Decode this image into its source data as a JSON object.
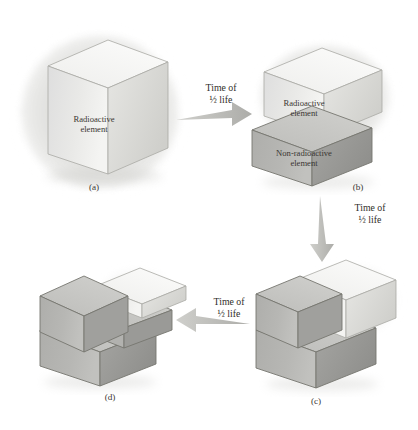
{
  "figure": {
    "colors": {
      "radioactive_front": "#e8e8e6",
      "radioactive_top": "#f2f2f0",
      "radioactive_side": "#d8d8d5",
      "nonradioactive_front": "#b4b4b2",
      "nonradioactive_top": "#c8c8c5",
      "nonradioactive_side": "#9c9c99",
      "outline": "#6a6a66",
      "text": "#3a3632",
      "glow": "#d9d9d6",
      "arrow": "#b9b9b6",
      "background": "#ffffff"
    }
  },
  "materials": {
    "radioactive": "Radioactive\nelement",
    "non_radioactive": "Non-radioactive\nelement"
  },
  "panels": [
    {
      "id": "a",
      "caption": "(a)",
      "face_label": "Radioactive\nelement",
      "glow": true,
      "radioactive_fraction": "1",
      "description": "Whole cube is radioactive element and emits a glow."
    },
    {
      "id": "b",
      "caption": "(b)",
      "top_label": "Radioactive\nelement",
      "bottom_label": "Non-radioactive\nelement",
      "glow": true,
      "radioactive_fraction": "1/2",
      "description": "Upper half radioactive, lower half non-radioactive."
    },
    {
      "id": "c",
      "caption": "(c)",
      "glow": true,
      "radioactive_fraction": "1/4",
      "description": "Lower half non-radioactive; upper half split, only the right quarter still radioactive."
    },
    {
      "id": "d",
      "caption": "(d)",
      "glow": false,
      "radioactive_fraction": "1/8",
      "description": "Only a thin upper-right slab remains radioactive; the rest is non-radioactive."
    }
  ],
  "arrows": [
    {
      "id": "arrow-a-to-b",
      "label": "Time of\n½ life",
      "direction": "right",
      "from": "a",
      "to": "b"
    },
    {
      "id": "arrow-b-to-c",
      "label": "Time of\n½ life",
      "direction": "down",
      "from": "b",
      "to": "c"
    },
    {
      "id": "arrow-c-to-d",
      "label": "Time of\n½ life",
      "direction": "left",
      "from": "c",
      "to": "d"
    }
  ]
}
